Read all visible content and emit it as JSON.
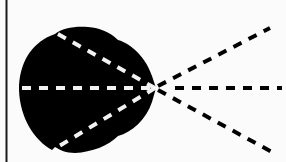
{
  "diagram": {
    "colors": {
      "background": "#fbfbfb",
      "blob": "#000000",
      "inner_dash": "#f2f2f2",
      "outer_dash": "#000000",
      "frame_line": "#1a1a1a"
    },
    "vertex": {
      "x": 155,
      "y": 88
    },
    "inner_rays": [
      {
        "name": "ray-inner-upper-left",
        "to": {
          "x": 55,
          "y": 33
        }
      },
      {
        "name": "ray-inner-left",
        "to": {
          "x": 18,
          "y": 88
        }
      },
      {
        "name": "ray-inner-lower-left",
        "to": {
          "x": 55,
          "y": 148
        }
      }
    ],
    "outer_rays": [
      {
        "name": "ray-outer-upper-right",
        "to": {
          "x": 270,
          "y": 28
        }
      },
      {
        "name": "ray-outer-right",
        "to": {
          "x": 280,
          "y": 88
        }
      },
      {
        "name": "ray-outer-lower-right",
        "to": {
          "x": 272,
          "y": 152
        }
      }
    ]
  }
}
